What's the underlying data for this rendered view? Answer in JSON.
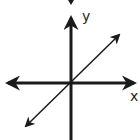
{
  "diagram": {
    "type": "coordinate-axes-with-line",
    "labels": {
      "x_axis": "x",
      "y_axis": "y"
    },
    "colors": {
      "stroke": "#1a1a1a",
      "background": "#ffffff"
    },
    "elements": {
      "x_axis": {
        "from": [
          5,
          83
        ],
        "to": [
          137,
          83
        ],
        "arrows": "both"
      },
      "y_axis": {
        "from": [
          71,
          140
        ],
        "to": [
          71,
          15
        ],
        "arrows": "both"
      },
      "line": {
        "from": [
          24,
          128
        ],
        "to": [
          121,
          33
        ],
        "arrows": "both",
        "slope": "positive",
        "passes_through_origin": true
      }
    }
  }
}
